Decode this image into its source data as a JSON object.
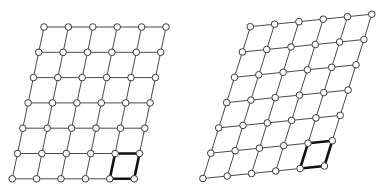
{
  "figure": {
    "panels": [
      {
        "name": "left-lattice",
        "cols": 6,
        "rows": 7,
        "origin": [
          44,
          27
        ],
        "col_vector": [
          24.4,
          0
        ],
        "row_vector": [
          -5.3,
          25.3
        ],
        "highlight_cell": {
          "row": 5,
          "col": 4
        }
      },
      {
        "name": "right-lattice",
        "cols": 6,
        "rows": 7,
        "origin": [
          250.3,
          26.7
        ],
        "col_vector": [
          24.3,
          -2.5
        ],
        "row_vector": [
          -7.9,
          25.3
        ],
        "highlight_cell": {
          "row": 5,
          "col": 4
        }
      }
    ],
    "style": {
      "edge_color": "#4a4a4a",
      "highlight_color": "#111111",
      "node_fill": "#ffffff",
      "node_stroke": "#3a3a3a",
      "node_radius": 3.3
    }
  }
}
